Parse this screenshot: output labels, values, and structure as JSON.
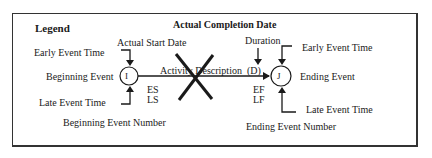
{
  "legend": {
    "title": "Legend",
    "heading": "Actual Completion Date"
  },
  "start_node": {
    "symbol": "I",
    "top_label": "Actual Start Date",
    "left_top": "Early  Event Time",
    "left_mid": "Beginning Event",
    "left_bottom": "Late Event Time",
    "bottom_label": "Beginning Event Number",
    "early_start": "ES",
    "late_start": "LS"
  },
  "activity": {
    "description": "Activity Description",
    "duration_label": "Duration",
    "duration_symbol": "(D)",
    "early_finish": "EF",
    "late_finish": "LF",
    "status_mark": "completed-x"
  },
  "end_node": {
    "symbol": "J",
    "right_top": "Early  Event Time",
    "right_mid": "Ending Event",
    "right_bottom": "Late Event Time",
    "bottom_label": "Ending Event Number"
  },
  "colors": {
    "line": "#1a1a1a",
    "frame": "#333333",
    "background": "#ffffff"
  }
}
